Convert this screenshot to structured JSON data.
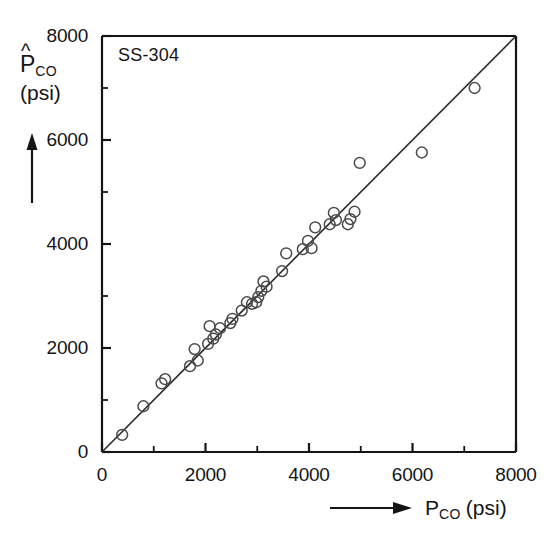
{
  "chart_data": {
    "type": "scatter",
    "title": "",
    "annotation": "SS-304",
    "xlabel": "P_CO (psi)",
    "ylabel": "P̂_CO (psi)",
    "xlabel_symbol": "P",
    "xlabel_subscript": "CO",
    "xlabel_unit": "(psi)",
    "ylabel_symbol": "P",
    "ylabel_hat": "^",
    "ylabel_subscript": "CO",
    "ylabel_unit": "(psi)",
    "xlim": [
      0,
      8000
    ],
    "ylim": [
      0,
      8000
    ],
    "xticks": [
      0,
      2000,
      4000,
      6000,
      8000
    ],
    "yticks": [
      0,
      2000,
      4000,
      6000,
      8000
    ],
    "xtick_labels": [
      "0",
      "2000",
      "4000",
      "6000",
      "8000"
    ],
    "ytick_labels": [
      "0",
      "2000",
      "4000",
      "6000",
      "8000"
    ],
    "minor_tick_interval": 1000,
    "grid": false,
    "legend": null,
    "marker": "open-circle",
    "reference_line": {
      "label": "y = x",
      "from": [
        0,
        0
      ],
      "to": [
        8000,
        8000
      ]
    },
    "x": [
      390,
      800,
      1150,
      1220,
      1700,
      1790,
      1850,
      2050,
      2080,
      2150,
      2200,
      2280,
      2480,
      2520,
      2700,
      2800,
      2900,
      2980,
      3020,
      3080,
      3120,
      3180,
      3480,
      3560,
      3880,
      3980,
      4050,
      4120,
      4400,
      4480,
      4520,
      4750,
      4800,
      4880,
      4980,
      6180,
      7200
    ],
    "y": [
      330,
      880,
      1320,
      1400,
      1650,
      1980,
      1760,
      2080,
      2420,
      2180,
      2260,
      2380,
      2480,
      2560,
      2720,
      2880,
      2850,
      2880,
      2980,
      3100,
      3280,
      3180,
      3480,
      3820,
      3900,
      4060,
      3920,
      4320,
      4380,
      4600,
      4460,
      4380,
      4480,
      4620,
      5560,
      5760,
      7000
    ]
  }
}
